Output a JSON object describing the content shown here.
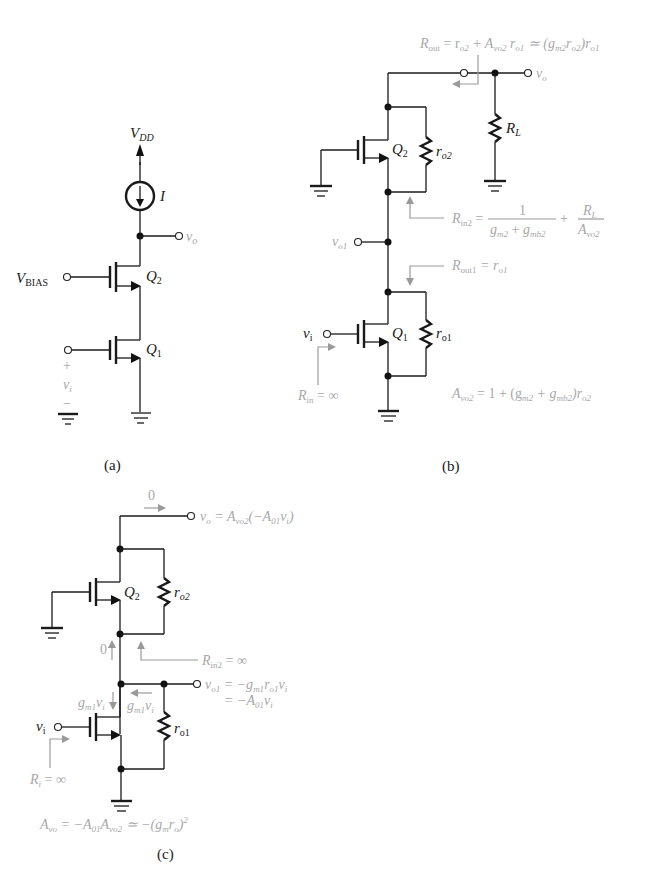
{
  "figure": {
    "a": {
      "caption": "(a)",
      "vdd": "V",
      "vdd_sub": "DD",
      "current": "I",
      "vo": "v",
      "vo_sub": "o",
      "vbias": "V",
      "vbias_sub": "BIAS",
      "q2": "Q",
      "q2_sub": "2",
      "q1": "Q",
      "q1_sub": "1",
      "plus": "+",
      "vi": "v",
      "vi_sub": "i",
      "minus": "−"
    },
    "b": {
      "caption": "(b)",
      "rout_eq": "R",
      "rout_sub": "out",
      "rout_rhs": " = r",
      "rout_rhs_sub1": "o2",
      "rout_rhs2": " + A",
      "rout_rhs_sub2": "vo2",
      "rout_rhs3": " r",
      "rout_rhs_sub3": "o1",
      "rout_rhs4": " ≃ (g",
      "rout_rhs_sub4": "m2",
      "rout_rhs5": "r",
      "rout_rhs_sub5": "o2",
      "rout_rhs6": ")r",
      "rout_rhs_sub6": "o1",
      "vo": "v",
      "vo_sub": "o",
      "rl": "R",
      "rl_sub": "L",
      "q2": "Q",
      "q2_sub": "2",
      "ro2": "r",
      "ro2_sub": "o2",
      "rin2": "R",
      "rin2_sub": "in2",
      "rin2_eq": " = ",
      "frac1_num": "1",
      "frac1_den_a": "g",
      "frac1_den_a_sub": "m2",
      "frac1_den_plus": " + ",
      "frac1_den_b": "g",
      "frac1_den_b_sub": "mb2",
      "plus": " + ",
      "frac2_num": "R",
      "frac2_num_sub": "L",
      "frac2_den": "A",
      "frac2_den_sub": "vo2",
      "vo1": "v",
      "vo1_sub": "o1",
      "rout1": "R",
      "rout1_sub": "out1",
      "rout1_eq": " = r",
      "rout1_eq_sub": "o1",
      "vi": "v",
      "vi_sub": "i",
      "q1": "Q",
      "q1_sub": "1",
      "ro1": "r",
      "ro1_sub": "o1",
      "rin": "R",
      "rin_sub": "in",
      "rin_eq": " = ∞",
      "avo2": "A",
      "avo2_sub": "vo2",
      "avo2_eq": " = 1 + (g",
      "avo2_eq_sub1": "m2",
      "avo2_eq2": " + g",
      "avo2_eq_sub2": "mb2",
      "avo2_eq3": ")r",
      "avo2_eq_sub3": "o2"
    },
    "c": {
      "caption": "(c)",
      "zero_top": "0",
      "vo_eq": "v",
      "vo_eq_sub": "o",
      "vo_eq2": " = A",
      "vo_eq_sub2": "vo2",
      "vo_eq3": "(−A",
      "vo_eq_sub3": "01",
      "vo_eq4": "v",
      "vo_eq_sub4": "i",
      "vo_eq5": ")",
      "q2": "Q",
      "q2_sub": "2",
      "ro2": "r",
      "ro2_sub": "o2",
      "zero_mid": "0",
      "rin2": "R",
      "rin2_sub": "in2",
      "rin2_eq": " = ∞",
      "gm1vi_left": "g",
      "gm1vi_left_sub": "m1",
      "gm1vi_left2": "v",
      "gm1vi_left_sub2": "i",
      "gm1vi_right": "g",
      "gm1vi_right_sub": "m1",
      "gm1vi_right2": "v",
      "gm1vi_right_sub2": "i",
      "vo1_line1": "v",
      "vo1_line1_sub": "o1",
      "vo1_line1_eq": " = −g",
      "vo1_line1_eq_sub": "m1",
      "vo1_line1_eq2": "r",
      "vo1_line1_eq_sub2": "o1",
      "vo1_line1_eq3": "v",
      "vo1_line1_eq_sub3": "i",
      "vo1_line2": "= −A",
      "vo1_line2_sub": "01",
      "vo1_line2_b": "v",
      "vo1_line2_sub2": "i",
      "vi": "v",
      "vi_sub": "i",
      "ro1": "r",
      "ro1_sub": "o1",
      "ri": "R",
      "ri_sub": "i",
      "ri_eq": " = ∞",
      "avo": "A",
      "avo_sub": "vo",
      "avo_eq": " = −A",
      "avo_eq_sub1": "01",
      "avo_eq2": "A",
      "avo_eq_sub2": "vo2",
      "avo_eq3": " ≃ −(g",
      "avo_eq_sub3": "m",
      "avo_eq4": "r",
      "avo_eq_sub4": "o",
      "avo_eq5": ")",
      "avo_eq_sup": "2"
    }
  }
}
